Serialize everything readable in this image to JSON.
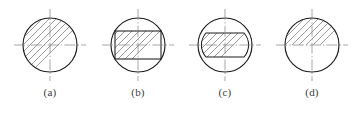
{
  "figure": {
    "background_color": "#ffffff",
    "outline_color": "#1c1c1c",
    "hatch_color": "#6f6f6f",
    "centerline_color": "#8a8a8a",
    "caption_color": "#3b3b3b",
    "hatch_angle_degrees": 45,
    "items": [
      {
        "id": "a",
        "caption": "(a)",
        "shape": "full-circle-section",
        "description": "Circle fully section-hatched across the whole area",
        "circle_radius": 27,
        "hatched_region": "entire-circle"
      },
      {
        "id": "b",
        "caption": "(b)",
        "shape": "circle-with-inscribed-rectangle",
        "description": "Circle with an inscribed horizontal rectangle, hatching inside the rectangle only",
        "circle_radius": 27,
        "rectangle_half_width": 23,
        "rectangle_half_height": 14,
        "hatched_region": "rectangle"
      },
      {
        "id": "c",
        "caption": "(c)",
        "shape": "circle-with-inscribed-stadium",
        "description": "Circle with an inscribed oblong (rectangle with arc ends), hatching inside the oblong only",
        "circle_radius": 27,
        "stadium_half_width": 25,
        "stadium_half_height": 12,
        "stadium_end_arc": true,
        "hatched_region": "stadium"
      },
      {
        "id": "d",
        "caption": "(d)",
        "shape": "half-circle-section",
        "description": "Circle with hatching only above the horizontal centreline",
        "circle_radius": 27,
        "hatched_region": "upper-half"
      }
    ],
    "centerlines": {
      "style": "dash-dot",
      "horizontal": true,
      "vertical": true,
      "overhang": 9
    }
  }
}
